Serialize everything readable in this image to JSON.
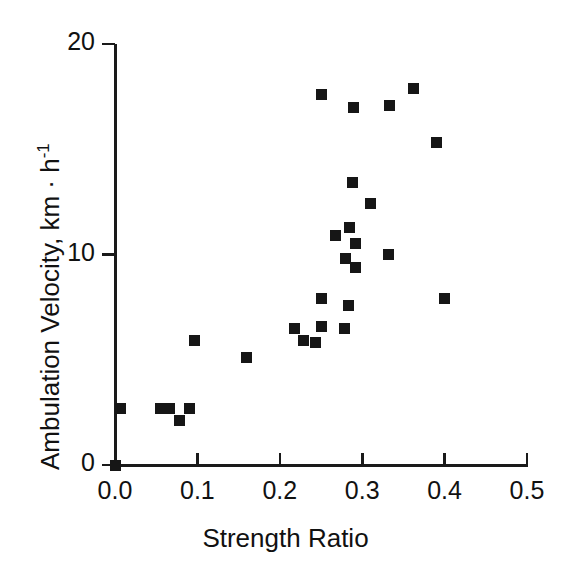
{
  "chart_data": {
    "type": "scatter",
    "title": "",
    "xlabel": "Strength Ratio",
    "ylabel": "Ambulation Velocity, km · h⁻¹",
    "ylabel_main": "Ambulation Velocity,  km · h",
    "ylabel_exponent": "-1",
    "xlim": [
      0.0,
      0.5
    ],
    "ylim": [
      0,
      20
    ],
    "xticks": [
      0.0,
      0.1,
      0.2,
      0.3,
      0.4,
      0.5
    ],
    "xticklabels": [
      "0.0",
      "0.1",
      "0.2",
      "0.3",
      "0.4",
      "0.5"
    ],
    "yticks": [
      0,
      10,
      20
    ],
    "yticklabels": [
      "0",
      "10",
      "20"
    ],
    "grid": false,
    "legend": null,
    "marker": "square",
    "marker_color": "#161616",
    "marker_size": 11,
    "points": [
      {
        "x": 0.0,
        "y": 0.0
      },
      {
        "x": 0.007,
        "y": 2.7
      },
      {
        "x": 0.055,
        "y": 2.7
      },
      {
        "x": 0.066,
        "y": 2.7
      },
      {
        "x": 0.078,
        "y": 2.1
      },
      {
        "x": 0.091,
        "y": 2.7
      },
      {
        "x": 0.096,
        "y": 5.9
      },
      {
        "x": 0.16,
        "y": 5.1
      },
      {
        "x": 0.218,
        "y": 6.5
      },
      {
        "x": 0.229,
        "y": 5.9
      },
      {
        "x": 0.243,
        "y": 5.8
      },
      {
        "x": 0.251,
        "y": 6.6
      },
      {
        "x": 0.251,
        "y": 7.9
      },
      {
        "x": 0.251,
        "y": 17.6
      },
      {
        "x": 0.268,
        "y": 10.9
      },
      {
        "x": 0.279,
        "y": 6.5
      },
      {
        "x": 0.28,
        "y": 9.8
      },
      {
        "x": 0.283,
        "y": 7.6
      },
      {
        "x": 0.285,
        "y": 11.3
      },
      {
        "x": 0.288,
        "y": 13.4
      },
      {
        "x": 0.29,
        "y": 17.0
      },
      {
        "x": 0.292,
        "y": 10.5
      },
      {
        "x": 0.292,
        "y": 9.4
      },
      {
        "x": 0.31,
        "y": 12.4
      },
      {
        "x": 0.332,
        "y": 10.0
      },
      {
        "x": 0.333,
        "y": 17.1
      },
      {
        "x": 0.362,
        "y": 17.9
      },
      {
        "x": 0.39,
        "y": 15.3
      },
      {
        "x": 0.4,
        "y": 7.9
      }
    ]
  },
  "axes": {
    "y_axis_name": "y-axis",
    "x_axis_name": "x-axis"
  }
}
